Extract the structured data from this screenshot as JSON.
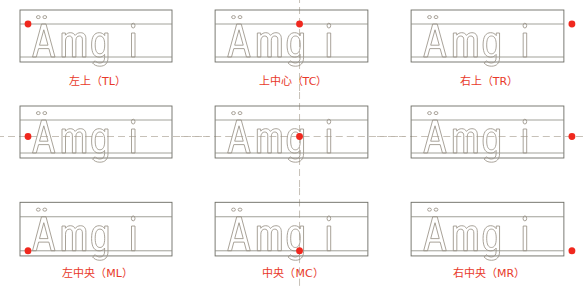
{
  "figure": {
    "title": "",
    "sample_text": "Ämgi",
    "colors": {
      "anchor_dot": "#f0281e",
      "label_text": "#e8392a",
      "box_outline": "#6e6e66",
      "glyph_outline": "#9a9388",
      "guide_line": "#8a8a80",
      "crosshair": "#b9b1a6",
      "background": "#ffffff"
    },
    "grid": {
      "rows": 3,
      "columns": 3
    },
    "cells": [
      {
        "id": "TL",
        "label": "左上（TL）",
        "anchor_code": "TL",
        "anchor_x": "left",
        "anchor_y": "top",
        "anchor_px": [
          8,
          24
        ],
        "crosshair": "none"
      },
      {
        "id": "TC",
        "label": "上中心（TC）",
        "anchor_code": "TC",
        "anchor_x": "center",
        "anchor_y": "top",
        "anchor_px": [
          84,
          24
        ],
        "crosshair": "vertical"
      },
      {
        "id": "TR",
        "label": "右上（TR）",
        "anchor_code": "TR",
        "anchor_x": "right",
        "anchor_y": "top",
        "anchor_px": [
          160,
          24
        ],
        "crosshair": "none"
      },
      {
        "id": "ML",
        "label": "左中央（ML）",
        "anchor_code": "ML",
        "anchor_x": "left",
        "anchor_y": "middle",
        "anchor_px": [
          8,
          42
        ],
        "crosshair": "horizontal-dashed"
      },
      {
        "id": "MC",
        "label": "中央（MC）",
        "anchor_code": "MC",
        "anchor_x": "center",
        "anchor_y": "middle",
        "anchor_px": [
          84,
          42
        ],
        "crosshair": "both"
      },
      {
        "id": "MR",
        "label": "右中央（MR）",
        "anchor_code": "MR",
        "anchor_x": "right",
        "anchor_y": "middle",
        "anchor_px": [
          160,
          42
        ],
        "crosshair": "horizontal-dashed"
      },
      {
        "id": "L",
        "label": "左（L）",
        "anchor_code": "L",
        "anchor_x": "left",
        "anchor_y": "baseline",
        "anchor_px": [
          8,
          57
        ],
        "crosshair": "none"
      },
      {
        "id": "C",
        "label": "中心（C）",
        "anchor_code": "C",
        "anchor_x": "center",
        "anchor_y": "baseline",
        "anchor_px": [
          84,
          57
        ],
        "crosshair": "vertical"
      },
      {
        "id": "R",
        "label": "右（R）",
        "anchor_code": "R",
        "anchor_x": "right",
        "anchor_y": "baseline",
        "anchor_px": [
          160,
          57
        ],
        "crosshair": "none"
      }
    ]
  }
}
